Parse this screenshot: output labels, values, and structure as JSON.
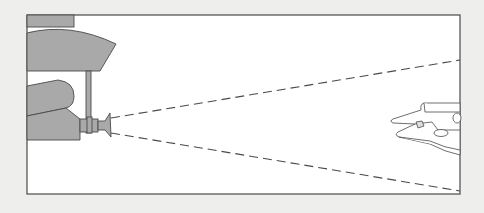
{
  "figure": {
    "colors": {
      "background": "#eeeeec",
      "panel": "#ffffff",
      "fill": "#a9a9a9",
      "stroke": "#4a4a4a"
    },
    "elements": [
      {
        "name": "mount-structure",
        "label": ""
      },
      {
        "name": "camera-lens",
        "label": ""
      },
      {
        "name": "projection-cone",
        "label": ""
      },
      {
        "name": "spaceship-model",
        "label": ""
      }
    ]
  }
}
